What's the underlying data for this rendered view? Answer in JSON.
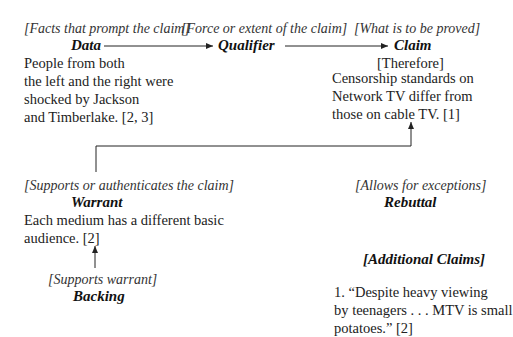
{
  "data": {
    "note": "[Facts that prompt the claim]",
    "heading": "Data",
    "lines": [
      "People from both",
      "the left and the right were",
      "shocked by Jackson",
      "and Timberlake. [2, 3]"
    ]
  },
  "qualifier": {
    "note": "[Force or extent of the claim]",
    "heading": "Qualifier"
  },
  "claim": {
    "note": "[What is to be proved]",
    "heading": "Claim",
    "therefore": "[Therefore]",
    "lines": [
      "Censorship standards on",
      "Network TV differ from",
      "those on cable TV. [1]"
    ]
  },
  "warrant": {
    "note": "[Supports or authenticates the claim]",
    "heading": "Warrant",
    "lines": [
      "Each medium has a different basic",
      "audience. [2]"
    ]
  },
  "rebuttal": {
    "note": "[Allows for exceptions]",
    "heading": "Rebuttal"
  },
  "backing": {
    "note": "[Supports warrant]",
    "heading": "Backing"
  },
  "additional_claims": {
    "heading": "[Additional Claims]",
    "lines": [
      "1. “Despite heavy viewing",
      "by teenagers . . . MTV is small",
      "potatoes.” [2]"
    ]
  }
}
